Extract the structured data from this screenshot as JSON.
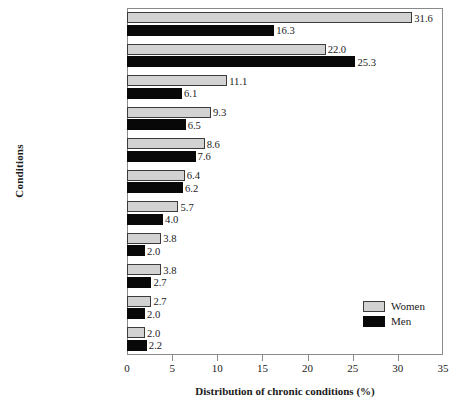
{
  "chart_data": {
    "type": "bar",
    "orientation": "horizontal",
    "title": "",
    "xlabel": "Distribution of chronic conditions (%)",
    "ylabel": "Conditions",
    "xlim": [
      0,
      35
    ],
    "xticks": [
      0,
      5,
      10,
      15,
      20,
      25,
      30,
      35
    ],
    "grid": false,
    "legend_position": "right-lower",
    "categories": [
      "Arthritis/\nrheumatism",
      "Heart conditions",
      "Hypertension",
      "Urinary\nincontinence",
      "Visual\nimpairment",
      "Diabetes",
      "Impairment of lower\nextremities and hips",
      "Mental and\nnervous conditions",
      "Impairment of\nback and spine",
      "Hearing\nimpairments",
      "Asthma"
    ],
    "category_footnotes": [
      "",
      "",
      "",
      "",
      "a",
      "",
      "",
      "b",
      "",
      "",
      ""
    ],
    "series": [
      {
        "name": "Women",
        "color": "#d2d2d2",
        "values": [
          31.6,
          22.0,
          11.1,
          9.3,
          8.6,
          6.4,
          5.7,
          3.8,
          3.8,
          2.7,
          2.0
        ],
        "labels": [
          "31.6",
          "22.0",
          "11.1",
          "9.3",
          "8.6",
          "6.4",
          "5.7",
          "3.8",
          "3.8",
          "2.7",
          "2.0"
        ]
      },
      {
        "name": "Men",
        "color": "#080808",
        "values": [
          16.3,
          25.3,
          6.1,
          6.5,
          7.6,
          6.2,
          4.0,
          2.0,
          2.7,
          2.0,
          2.2
        ],
        "labels": [
          "16.3",
          "25.3",
          "6.1",
          "6.5",
          "7.6",
          "6.2",
          "4.0",
          "2.0",
          "2.7",
          "2.0",
          "2.2"
        ]
      }
    ]
  },
  "legend": {
    "items": [
      {
        "label": "Women",
        "color": "#d2d2d2"
      },
      {
        "label": "Men",
        "color": "#080808"
      }
    ]
  },
  "axes": {
    "x_title": "Distribution of chronic conditions (%)",
    "y_title": "Conditions",
    "x_tick_labels": [
      "0",
      "5",
      "10",
      "15",
      "20",
      "25",
      "30",
      "35"
    ]
  }
}
